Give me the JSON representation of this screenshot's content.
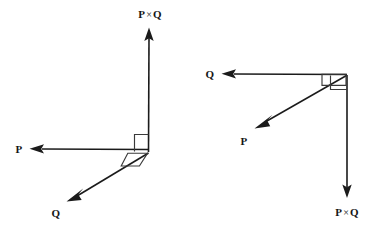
{
  "figure": {
    "title": "Cross product right-hand rule diagrams",
    "background_color": "#ffffff",
    "stroke_color": "#1b1b1b",
    "label_color": "#161616",
    "width": 380,
    "height": 232
  },
  "diagrams": [
    {
      "id": "left-diagram",
      "name": "p-cross-q-upward",
      "vertex": {
        "x": 148,
        "y": 152
      },
      "vectors": [
        {
          "id": "left-pq",
          "symbol_main": "P",
          "symbol_cross": "×",
          "symbol_second": "Q",
          "label": "P × Q",
          "direction": "up",
          "tip": {
            "x": 149,
            "y": 28
          },
          "label_pos": {
            "x": 150,
            "y": 14
          }
        },
        {
          "id": "left-p",
          "symbol_main": "P",
          "symbol_cross": "",
          "symbol_second": "",
          "label": "P",
          "direction": "left",
          "tip": {
            "x": 30,
            "y": 149
          },
          "label_pos": {
            "x": 19,
            "y": 149
          }
        },
        {
          "id": "left-q",
          "symbol_main": "Q",
          "symbol_cross": "",
          "symbol_second": "",
          "label": "Q",
          "direction": "down-left",
          "tip": {
            "x": 67,
            "y": 200
          },
          "label_pos": {
            "x": 56,
            "y": 213
          }
        }
      ],
      "angle_markers": [
        {
          "id": "left-square",
          "type": "right-angle-square",
          "between": "P and P × Q"
        },
        {
          "id": "left-skew",
          "type": "right-angle-parallelogram",
          "between": "P and Q"
        }
      ]
    },
    {
      "id": "right-diagram",
      "name": "p-cross-q-downward",
      "vertex": {
        "x": 347,
        "y": 75
      },
      "vectors": [
        {
          "id": "right-q",
          "symbol_main": "Q",
          "symbol_cross": "",
          "symbol_second": "",
          "label": "Q",
          "direction": "left",
          "tip": {
            "x": 222,
            "y": 74
          },
          "label_pos": {
            "x": 210,
            "y": 74
          }
        },
        {
          "id": "right-p",
          "symbol_main": "P",
          "symbol_cross": "",
          "symbol_second": "",
          "label": "P",
          "direction": "down-left",
          "tip": {
            "x": 255,
            "y": 127
          },
          "label_pos": {
            "x": 244,
            "y": 141
          }
        },
        {
          "id": "right-pq",
          "symbol_main": "P",
          "symbol_cross": "×",
          "symbol_second": "Q",
          "label": "P × Q",
          "direction": "down",
          "tip": {
            "x": 347,
            "y": 197
          },
          "label_pos": {
            "x": 347,
            "y": 212
          }
        }
      ],
      "angle_markers": [
        {
          "id": "right-square",
          "type": "right-angle-square",
          "between": "Q and P × Q"
        },
        {
          "id": "right-skew",
          "type": "right-angle-parallelogram",
          "between": "Q and P"
        }
      ]
    }
  ]
}
